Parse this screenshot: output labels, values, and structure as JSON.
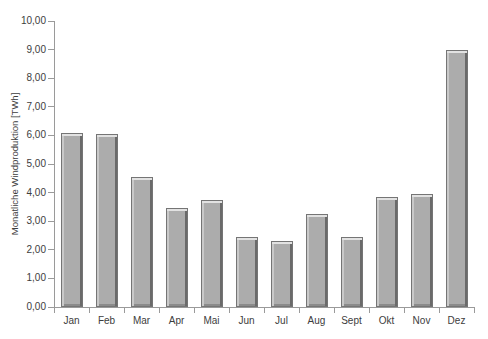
{
  "chart_data": {
    "type": "bar",
    "title": "",
    "xlabel": "",
    "ylabel": "Monatliche Windproduktion [TWh]",
    "categories": [
      "Jan",
      "Feb",
      "Mar",
      "Apr",
      "Mai",
      "Jun",
      "Jul",
      "Aug",
      "Sept",
      "Okt",
      "Nov",
      "Dez"
    ],
    "values": [
      6.1,
      6.05,
      4.55,
      3.45,
      3.75,
      2.45,
      2.3,
      3.25,
      2.45,
      3.85,
      3.95,
      9.0
    ],
    "ylim": [
      0,
      10
    ],
    "y_tick_step": 1,
    "y_tick_labels": [
      "0,00",
      "1,00",
      "2,00",
      "3,00",
      "4,00",
      "5,00",
      "6,00",
      "7,00",
      "8,00",
      "9,00",
      "10,00"
    ],
    "grid": false,
    "legend": false,
    "colors": {
      "background": "#ffffff",
      "axis": "#9a9a9a",
      "text": "#3d3d3d",
      "bar_fill": "#acacac",
      "bar_bevel_top": "#e2e2e2",
      "bar_bevel_left": "#c9c9c9",
      "bar_bevel_right": "#6a6a6a",
      "bar_bevel_bottom": "#8b8b8b",
      "bar_border": "#757575"
    }
  }
}
